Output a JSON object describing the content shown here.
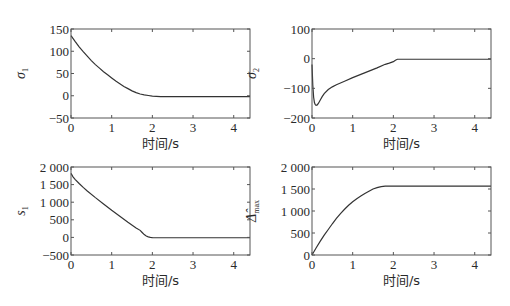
{
  "chart_data": [
    {
      "id": "sigma1",
      "type": "line",
      "ylabel": "σ",
      "ylabel_sub": "1",
      "xlabel": "时间/s",
      "xlim": [
        0,
        4.4
      ],
      "ylim": [
        -50,
        150
      ],
      "xticks": [
        0,
        1,
        2,
        3,
        4
      ],
      "yticks": [
        -50,
        0,
        50,
        100,
        150
      ],
      "ytick_labels": [
        "−50",
        "0",
        "50",
        "100",
        "150"
      ],
      "grid": false,
      "box": {
        "x": 71,
        "y": 29,
        "w": 179,
        "h": 89
      },
      "x": [
        0,
        0.1,
        0.2,
        0.3,
        0.4,
        0.5,
        0.6,
        0.7,
        0.8,
        0.9,
        1.0,
        1.1,
        1.2,
        1.3,
        1.4,
        1.5,
        1.6,
        1.7,
        1.8,
        1.9,
        2.0,
        2.1,
        2.2,
        2.5,
        3.0,
        3.5,
        4.0,
        4.4
      ],
      "y": [
        135,
        122,
        110,
        99,
        89,
        79,
        70,
        62,
        54,
        47,
        40,
        33,
        27,
        21,
        16,
        11,
        7,
        4,
        2,
        0.5,
        -1,
        -1.5,
        -2,
        -2,
        -2,
        -2,
        -2,
        -2
      ]
    },
    {
      "id": "sigma2",
      "type": "line",
      "ylabel": "σ",
      "ylabel_sub": "2",
      "xlabel": "时间/s",
      "xlim": [
        0,
        4.4
      ],
      "ylim": [
        -200,
        100
      ],
      "xticks": [
        0,
        1,
        2,
        3,
        4
      ],
      "yticks": [
        -200,
        -100,
        0,
        100
      ],
      "ytick_labels": [
        "−200",
        "−100",
        "0",
        "100"
      ],
      "grid": false,
      "box": {
        "x": 312,
        "y": 29,
        "w": 179,
        "h": 89
      },
      "x": [
        0,
        0.02,
        0.04,
        0.06,
        0.08,
        0.1,
        0.13,
        0.16,
        0.2,
        0.25,
        0.3,
        0.4,
        0.5,
        0.6,
        0.8,
        1.0,
        1.2,
        1.4,
        1.6,
        1.8,
        1.9,
        2.0,
        2.05,
        2.1,
        2.5,
        3.0,
        3.5,
        4.0,
        4.4
      ],
      "y": [
        -20,
        -90,
        -130,
        -148,
        -155,
        -157,
        -156,
        -150,
        -140,
        -128,
        -118,
        -104,
        -95,
        -88,
        -76,
        -64,
        -53,
        -42,
        -31,
        -19,
        -15,
        -10,
        -5,
        -2,
        -2,
        -2,
        -2,
        -2,
        -2
      ]
    },
    {
      "id": "s1",
      "type": "line",
      "ylabel": "s",
      "ylabel_sub": "1",
      "xlabel": "时间/s",
      "xlim": [
        0,
        4.4
      ],
      "ylim": [
        -500,
        2000
      ],
      "xticks": [
        0,
        1,
        2,
        3,
        4
      ],
      "yticks": [
        -500,
        0,
        500,
        1000,
        1500,
        2000
      ],
      "ytick_labels": [
        "−500",
        "0",
        "500",
        "1 000",
        "1 500",
        "2 000"
      ],
      "grid": false,
      "box": {
        "x": 71,
        "y": 167,
        "w": 179,
        "h": 88
      },
      "x": [
        0,
        0.05,
        0.1,
        0.2,
        0.3,
        0.4,
        0.6,
        0.8,
        1.0,
        1.2,
        1.4,
        1.6,
        1.7,
        1.75,
        1.8,
        1.85,
        1.9,
        1.95,
        2.0,
        2.1,
        2.5,
        3.0,
        3.5,
        4.0,
        4.4
      ],
      "y": [
        1820,
        1720,
        1650,
        1530,
        1420,
        1320,
        1130,
        950,
        770,
        600,
        430,
        270,
        200,
        140,
        80,
        40,
        15,
        0,
        -5,
        -10,
        -10,
        -10,
        -10,
        -10,
        -10
      ]
    },
    {
      "id": "delta_max",
      "type": "line",
      "ylabel": "Δ̂",
      "ylabel_sub": "max",
      "xlabel": "时间/s",
      "xlim": [
        0,
        4.4
      ],
      "ylim": [
        0,
        2000
      ],
      "xticks": [
        0,
        1,
        2,
        3,
        4
      ],
      "yticks": [
        0,
        500,
        1000,
        1500,
        2000
      ],
      "ytick_labels": [
        "0",
        "500",
        "1 000",
        "1 500",
        "2 000"
      ],
      "grid": false,
      "box": {
        "x": 312,
        "y": 167,
        "w": 179,
        "h": 88
      },
      "x": [
        0,
        0.05,
        0.1,
        0.2,
        0.3,
        0.4,
        0.5,
        0.6,
        0.7,
        0.8,
        0.9,
        1.0,
        1.1,
        1.2,
        1.3,
        1.4,
        1.5,
        1.6,
        1.7,
        1.8,
        2.0,
        2.5,
        3.0,
        3.5,
        4.0,
        4.4
      ],
      "y": [
        0,
        80,
        160,
        310,
        450,
        580,
        710,
        830,
        940,
        1040,
        1130,
        1210,
        1280,
        1340,
        1400,
        1450,
        1500,
        1530,
        1555,
        1565,
        1565,
        1565,
        1565,
        1565,
        1565,
        1565
      ]
    }
  ],
  "xlabels": [
    "时间/s",
    "时间/s",
    "时间/s",
    "时间/s"
  ],
  "line_color": "#333333",
  "axis_color": "#555555"
}
